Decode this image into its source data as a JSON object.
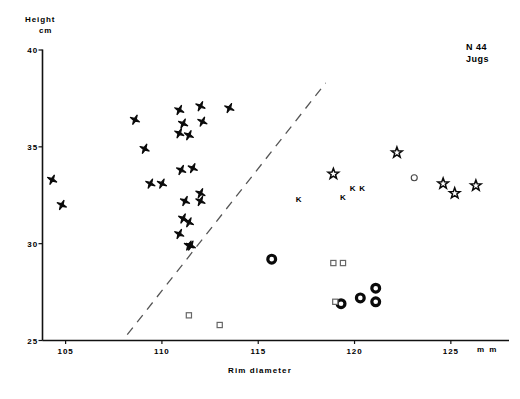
{
  "figure": {
    "annotation_line1": "N 44",
    "annotation_line2": "Jugs",
    "ylabel_line1": "Height",
    "ylabel_line2": "cm",
    "xlabel": "Rim diameter",
    "xunit": "m m"
  },
  "chart_data": {
    "type": "scatter",
    "title": "N 44 Jugs",
    "xlabel": "Rim diameter",
    "ylabel": "Height cm",
    "xunit": "m m",
    "yunit": "cm",
    "xlim": [
      103.8,
      127.5
    ],
    "ylim": [
      25,
      40
    ],
    "xticks": [
      105,
      110,
      115,
      120,
      125
    ],
    "yticks": [
      25,
      30,
      35,
      40
    ],
    "grid": false,
    "legend": null,
    "annotations": [
      {
        "text": "N 44",
        "x": 126.0,
        "y": 39.0
      },
      {
        "text": "Jugs",
        "x": 126.0,
        "y": 38.4
      }
    ],
    "reference_line": {
      "style": "dashed",
      "x": [
        108.2,
        118.5
      ],
      "y": [
        25.3,
        38.3
      ]
    },
    "series": [
      {
        "name": "filled-star",
        "marker": "filled-star",
        "points": [
          [
            104.3,
            33.3
          ],
          [
            104.8,
            32.0
          ],
          [
            108.6,
            36.4
          ],
          [
            109.1,
            34.9
          ],
          [
            109.4,
            33.1
          ],
          [
            110.0,
            33.1
          ],
          [
            110.9,
            36.9
          ],
          [
            111.1,
            36.2
          ],
          [
            110.9,
            35.7
          ],
          [
            111.4,
            35.6
          ],
          [
            111.0,
            33.8
          ],
          [
            111.6,
            33.9
          ],
          [
            111.2,
            32.2
          ],
          [
            111.1,
            31.3
          ],
          [
            111.4,
            31.1
          ],
          [
            110.9,
            30.5
          ],
          [
            111.4,
            29.9
          ],
          [
            111.5,
            29.9
          ],
          [
            112.0,
            37.1
          ],
          [
            112.1,
            36.3
          ],
          [
            112.0,
            32.6
          ],
          [
            112.0,
            32.2
          ],
          [
            113.5,
            37.0
          ]
        ]
      },
      {
        "name": "open-star",
        "marker": "open-star",
        "points": [
          [
            118.9,
            33.6
          ],
          [
            122.2,
            34.7
          ],
          [
            124.6,
            33.1
          ],
          [
            125.2,
            32.6
          ],
          [
            126.3,
            33.0
          ]
        ]
      },
      {
        "name": "letter-K",
        "marker": "letter-K",
        "points": [
          [
            117.1,
            32.3
          ],
          [
            119.4,
            32.4
          ],
          [
            119.9,
            32.9
          ],
          [
            120.4,
            32.9
          ]
        ]
      },
      {
        "name": "ring",
        "marker": "ring",
        "points": [
          [
            115.7,
            29.2
          ],
          [
            119.3,
            26.9
          ],
          [
            120.3,
            27.2
          ],
          [
            121.1,
            27.7
          ],
          [
            121.1,
            27.0
          ]
        ]
      },
      {
        "name": "open-square",
        "marker": "open-square",
        "points": [
          [
            111.4,
            26.3
          ],
          [
            113.0,
            25.8
          ],
          [
            118.9,
            29.0
          ],
          [
            119.4,
            29.0
          ],
          [
            119.0,
            27.0
          ]
        ]
      },
      {
        "name": "open-circle-small",
        "marker": "open-circle",
        "points": [
          [
            123.1,
            33.4
          ]
        ]
      }
    ]
  }
}
